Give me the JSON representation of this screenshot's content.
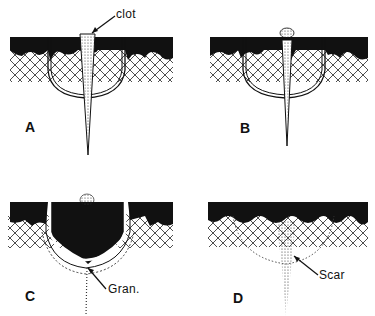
{
  "figure": {
    "type": "wound-healing-stages",
    "panels": [
      {
        "id": "A",
        "label": "A",
        "annotation": "clot"
      },
      {
        "id": "B",
        "label": "B",
        "annotation": ""
      },
      {
        "id": "C",
        "label": "C",
        "annotation": "Gran."
      },
      {
        "id": "D",
        "label": "D",
        "annotation": "Scar"
      }
    ]
  },
  "colors": {
    "ink": "#111111",
    "background": "#ffffff"
  }
}
